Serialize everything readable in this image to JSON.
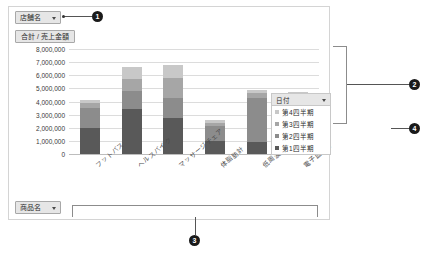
{
  "chart_data": {
    "type": "bar",
    "subtype": "stacked-column",
    "title": "",
    "value_field_label": "合計 / 売上金額",
    "categories": [
      "フットバス",
      "ヘルスバイク",
      "マッサージチェア",
      "体脂肪計",
      "低周波治療器",
      "電子血圧計"
    ],
    "series": [
      {
        "name": "第1四半期",
        "color": "#595959",
        "values": [
          2000000,
          3400000,
          2750000,
          1000000,
          900000,
          1500000
        ]
      },
      {
        "name": "第2四半期",
        "color": "#8c8c8c",
        "values": [
          1500000,
          1400000,
          1550000,
          1100000,
          3400000,
          2300000
        ]
      },
      {
        "name": "第3四半期",
        "color": "#a6a6a6",
        "values": [
          350000,
          900000,
          1500000,
          300000,
          350000,
          550000
        ]
      },
      {
        "name": "第4四半期",
        "color": "#c8c8c8",
        "values": [
          250000,
          900000,
          1000000,
          200000,
          200000,
          400000
        ]
      }
    ],
    "totals": [
      4100000,
      6600000,
      6800000,
      2600000,
      4850000,
      4750000
    ],
    "ylabel": "",
    "xlabel": "",
    "ylim": [
      0,
      8000000
    ],
    "ytick_step": 1000000,
    "ytick_labels": [
      "8,000,000",
      "7,000,000",
      "6,000,000",
      "5,000,000",
      "4,000,000",
      "3,000,000",
      "2,000,000",
      "1,000,000",
      "0"
    ],
    "grid": true,
    "legend_position": "right"
  },
  "filters": {
    "store": {
      "label": "店舗名",
      "icon": "chevron-down-icon"
    },
    "product": {
      "label": "商品名",
      "icon": "chevron-down-icon"
    }
  },
  "value_button": {
    "label": "合計 / 売上金額"
  },
  "legend": {
    "title": "日付",
    "icon": "chevron-down-icon",
    "items": [
      {
        "label": "第4四半期",
        "color": "#c8c8c8"
      },
      {
        "label": "第3四半期",
        "color": "#a6a6a6"
      },
      {
        "label": "第2四半期",
        "color": "#8c8c8c"
      },
      {
        "label": "第1四半期",
        "color": "#595959"
      }
    ]
  },
  "callouts": [
    {
      "number": "1"
    },
    {
      "number": "2"
    },
    {
      "number": "3"
    },
    {
      "number": "4"
    }
  ]
}
